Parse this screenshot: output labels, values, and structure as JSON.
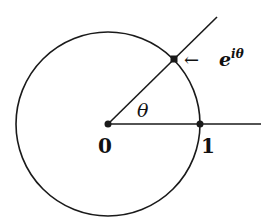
{
  "diagram": {
    "type": "unit-circle",
    "center": {
      "x": 108,
      "y": 124
    },
    "radius": 92,
    "stroke_color": "#1a1a1a",
    "labels": {
      "origin": "0",
      "one": "1",
      "angle": "θ",
      "point_base": "e",
      "point_exp": "iθ",
      "arrow": "←"
    },
    "angle_degrees": 45
  }
}
